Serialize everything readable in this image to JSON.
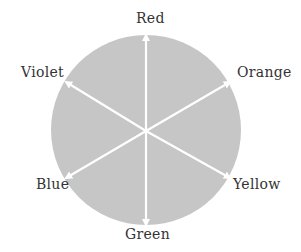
{
  "diagram": {
    "circle_fill": "#c6c6c6",
    "arrow_color": "#ffffff",
    "labels": {
      "top": "Red",
      "upper_right": "Orange",
      "lower_right": "Yellow",
      "bottom": "Green",
      "lower_left": "Blue",
      "upper_left": "Violet"
    }
  }
}
